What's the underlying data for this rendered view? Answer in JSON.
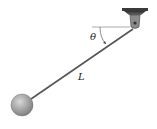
{
  "figure": {
    "type": "pendulum",
    "labels": {
      "angle": "θ",
      "length": "L"
    },
    "caption": "",
    "colors": {
      "rod": "#555555",
      "bob_light": "#d8d8d8",
      "bob_dark": "#7a7a7a",
      "mount": "#4a4a4a",
      "reference_line": "#888888"
    }
  }
}
